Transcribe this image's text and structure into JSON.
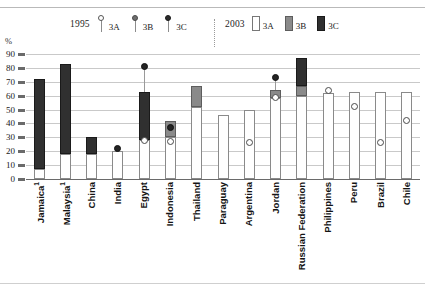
{
  "header": {
    "clipped_title": "",
    "y_axis_unit": "%"
  },
  "legend": {
    "groups": [
      {
        "year": "1995",
        "marker_style": "circle-on-stem",
        "items": [
          {
            "label": "3A",
            "swatch": "open-circle-icon",
            "color": "#ffffff"
          },
          {
            "label": "3B",
            "swatch": "grey-circle-icon",
            "color": "#6e6e6e"
          },
          {
            "label": "3C",
            "swatch": "dark-circle-icon",
            "color": "#2b2b2b"
          }
        ]
      },
      {
        "year": "2003",
        "marker_style": "bar-swatch",
        "items": [
          {
            "label": "3A",
            "swatch": "white-bar-icon",
            "color": "#ffffff"
          },
          {
            "label": "3B",
            "swatch": "grey-bar-icon",
            "color": "#8a8a8a"
          },
          {
            "label": "3C",
            "swatch": "dark-bar-icon",
            "color": "#303030"
          }
        ]
      }
    ]
  },
  "chart_data": {
    "type": "bar",
    "title": "",
    "xlabel": "",
    "ylabel": "%",
    "ylim": [
      0,
      90
    ],
    "ytick_step": 10,
    "yticks": [
      0,
      10,
      20,
      30,
      40,
      50,
      60,
      70,
      80,
      90
    ],
    "grid": true,
    "legend_position": "top",
    "stacked": true,
    "categories": [
      "Jamaica¹",
      "Malaysia¹",
      "China",
      "India",
      "Egypt",
      "Indonesia",
      "Thailand",
      "Paraguay",
      "Argentina",
      "Jordan",
      "Russian Federation",
      "Philippines",
      "Peru",
      "Brazil",
      "Chile"
    ],
    "series": [
      {
        "name": "2003 3A",
        "key": "b2003_3A",
        "color": "#ffffff",
        "values": [
          7,
          18,
          18,
          20,
          28,
          30,
          52,
          46,
          50,
          58,
          60,
          62,
          63,
          63,
          63
        ]
      },
      {
        "name": "2003 3B",
        "key": "b2003_3B",
        "color": "#8a8a8a",
        "values": [
          0,
          0,
          0,
          0,
          0,
          42,
          67,
          0,
          0,
          64,
          67,
          0,
          0,
          0,
          0
        ]
      },
      {
        "name": "2003 3C",
        "key": "b2003_3C",
        "color": "#303030",
        "values": [
          72,
          83,
          30,
          0,
          63,
          0,
          0,
          0,
          0,
          0,
          87,
          0,
          0,
          0,
          0
        ]
      }
    ],
    "points_1995": [
      {
        "name": "1995 3A",
        "key": "p1995_3A",
        "marker": "open-circle",
        "values": [
          null,
          null,
          null,
          null,
          28,
          27,
          null,
          null,
          26,
          59,
          null,
          64,
          52,
          26,
          42
        ]
      },
      {
        "name": "1995 3B",
        "key": "p1995_3B",
        "marker": "grey-circle",
        "values": [
          null,
          null,
          null,
          null,
          null,
          null,
          null,
          null,
          null,
          null,
          null,
          null,
          null,
          null,
          null
        ]
      },
      {
        "name": "1995 3C",
        "key": "p1995_3C",
        "marker": "dark-circle",
        "values": [
          null,
          null,
          null,
          22,
          81,
          37,
          null,
          null,
          null,
          73,
          null,
          null,
          null,
          null,
          null
        ]
      }
    ]
  }
}
